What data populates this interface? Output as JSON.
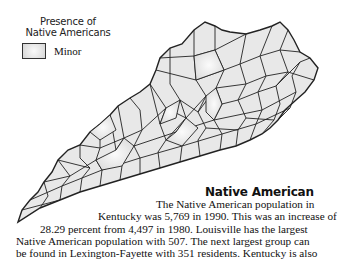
{
  "legend": {
    "title_line1": "Presence of",
    "title_line2": "Native Americans",
    "items": [
      {
        "label": "Minor",
        "swatch": "light-gray-gradient"
      }
    ]
  },
  "map": {
    "region": "Kentucky counties",
    "fill_color": "#e6e6e6",
    "highlight_color": "#f7f7f7",
    "border_color": "#222222"
  },
  "article": {
    "title": "Native American",
    "lines": [
      "The Native American population in",
      "Kentucky was 5,769 in 1990. This was an increase of",
      "28.29 percent from 4,497 in 1980. Louisville has the largest",
      "Native American population with 507. The next largest group can",
      "be found in Lexington-Fayette with 351 residents. Kentucky is also"
    ]
  }
}
